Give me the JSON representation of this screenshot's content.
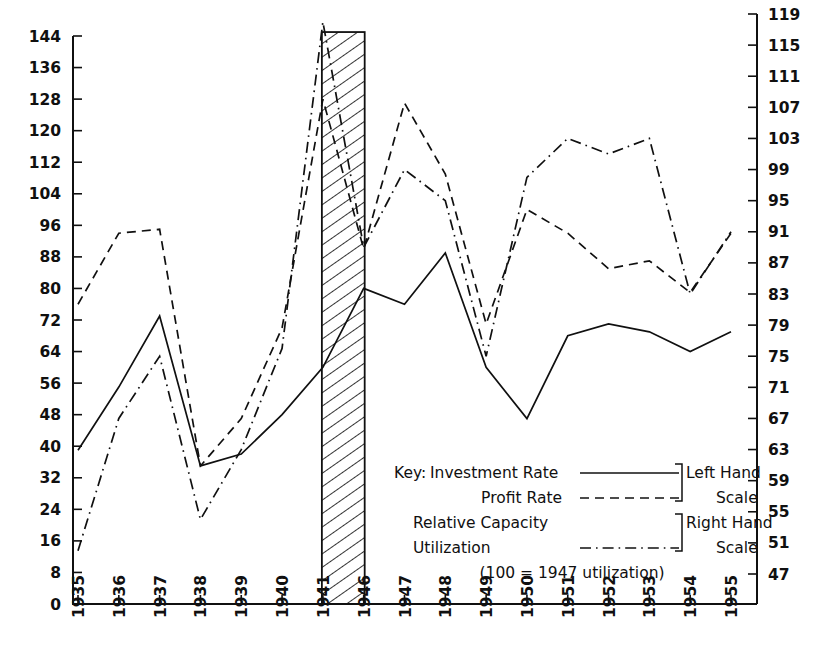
{
  "chart_data": {
    "type": "line",
    "title": "",
    "xlabel": "",
    "ylabel": "",
    "grid": false,
    "legend_position": "inside-lower-right",
    "categories": [
      "1935",
      "1936",
      "1937",
      "1938",
      "1939",
      "1940",
      "1941",
      "1946",
      "1947",
      "1948",
      "1949",
      "1950",
      "1951",
      "1952",
      "1953",
      "1954",
      "1955"
    ],
    "left_axis": {
      "label": "Left Hand Scale",
      "min": 0,
      "max": 144,
      "step": 8,
      "ticks": [
        0,
        8,
        16,
        24,
        32,
        40,
        48,
        56,
        64,
        72,
        80,
        88,
        96,
        104,
        112,
        120,
        128,
        136,
        144
      ]
    },
    "right_axis": {
      "label": "Right Hand Scale",
      "min": 47,
      "max": 119,
      "step": 4,
      "ticks": [
        47,
        51,
        55,
        59,
        63,
        67,
        71,
        75,
        79,
        83,
        87,
        91,
        95,
        99,
        103,
        107,
        111,
        115,
        119
      ]
    },
    "series": [
      {
        "name": "Investment Rate",
        "axis": "left",
        "style": "solid",
        "values": [
          39,
          55,
          73,
          35,
          38,
          48,
          60,
          80,
          76,
          89,
          60,
          47,
          68,
          71,
          69,
          64,
          69
        ]
      },
      {
        "name": "Profit Rate",
        "axis": "left",
        "style": "dashed",
        "values": [
          76,
          94,
          95,
          35,
          47,
          70,
          128,
          90,
          127,
          109,
          71,
          100,
          94,
          85,
          87,
          79,
          94
        ]
      },
      {
        "name": "Relative Capacity Utilization",
        "axis": "right",
        "style": "dash-dot",
        "values": [
          50,
          67,
          75,
          54,
          63,
          76,
          118,
          89,
          99,
          95,
          75,
          98,
          103,
          101,
          103,
          83,
          91
        ]
      }
    ],
    "shaded_band": {
      "label": "war years gap",
      "from_category": "1941",
      "to_category": "1946",
      "top_value_left_scale": 145,
      "fill": "diagonal-hatch"
    },
    "annotations": [
      "(100  = 1947 utilization)"
    ]
  },
  "legend": {
    "key_label": "Key:",
    "items": [
      {
        "label": "Investment Rate",
        "style": "solid"
      },
      {
        "label": "Profit Rate",
        "style": "dashed"
      },
      {
        "label": "Relative  Capacity",
        "label2": "Utilization",
        "style": "dash-dot"
      }
    ],
    "left_scale_line1": "Left Hand",
    "left_scale_line2": "Scale",
    "right_scale_line1": "Right Hand",
    "right_scale_line2": "Scale",
    "note": "(100  = 1947 utilization)"
  },
  "colors": {
    "ink": "#101010",
    "paper": "#ffffff"
  }
}
